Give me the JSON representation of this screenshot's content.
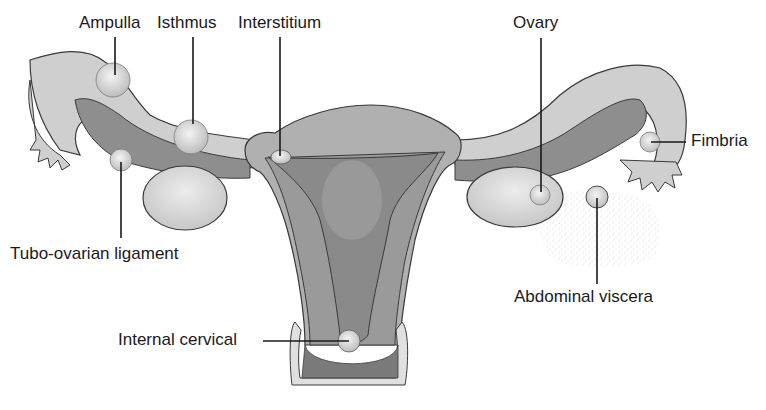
{
  "diagram": {
    "colors": {
      "outline": "#3a3a3a",
      "tube_light": "#c8c8c8",
      "tube_dark": "#8e8e8e",
      "uterus_wall": "#a8a8a8",
      "cavity": "#8a8a8a",
      "ovary": "#d4d4d4",
      "implant": "#e6e6e6",
      "viscera_stipple": "#dcdcdc"
    },
    "labels": {
      "ampulla": "Ampulla",
      "isthmus": "Isthmus",
      "interstitium": "Interstitium",
      "ovary": "Ovary",
      "fimbria": "Fimbria",
      "tubo_ovarian": "Tubo-ovarian ligament",
      "abdominal_viscera": "Abdominal viscera",
      "internal_cervical": "Internal cervical"
    }
  }
}
